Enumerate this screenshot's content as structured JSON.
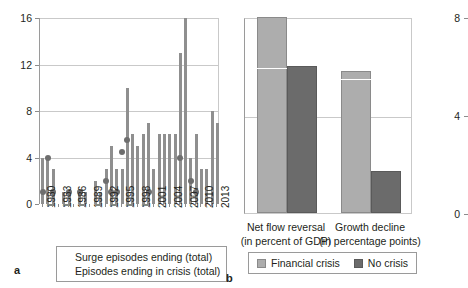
{
  "colors": {
    "light_gray": "#adadad",
    "dark_gray": "#6b6b6b",
    "bar_gray": "#8f8f8f",
    "dot_gray": "#6e6e6e",
    "grid": "#c9c9c9",
    "axis": "#8c8c8c"
  },
  "panel_a": {
    "letter": "a",
    "legend": [
      {
        "marker": "square",
        "label": "Surge episodes ending (total)"
      },
      {
        "marker": "circle",
        "label": "Episodes ending in crisis (total)"
      }
    ],
    "y_ticks": [
      "0",
      "4",
      "8",
      "12",
      "16"
    ],
    "y_values": [
      0,
      4,
      8,
      12,
      16
    ],
    "x_tick_labels": [
      "1980",
      "1983",
      "1986",
      "1989",
      "1992",
      "1995",
      "1998",
      "2001",
      "2004",
      "2007",
      "2010",
      "2013"
    ]
  },
  "panel_b": {
    "letter": "b",
    "y_ticks": [
      "0",
      "4",
      "8"
    ],
    "y_values": [
      0,
      4,
      8
    ],
    "categories": [
      {
        "line1": "Net  flow reversal",
        "line2": "(in percent of GDP)"
      },
      {
        "line1": "Growth decline",
        "line2": "(in percentage points)"
      }
    ],
    "legend": [
      {
        "swatch": "light",
        "label": "Financial crisis"
      },
      {
        "swatch": "dark",
        "label": "No crisis"
      }
    ]
  },
  "chart_data": [
    {
      "type": "bar",
      "panel": "a",
      "title": "",
      "xlabel": "",
      "ylabel": "",
      "ylim": [
        0,
        16
      ],
      "yticks": [
        0,
        4,
        8,
        12,
        16
      ],
      "grid": true,
      "legend_position": "bottom",
      "categories": [
        "1980",
        "1981",
        "1982",
        "1983",
        "1984",
        "1985",
        "1986",
        "1987",
        "1988",
        "1989",
        "1990",
        "1991",
        "1992",
        "1993",
        "1994",
        "1995",
        "1996",
        "1997",
        "1998",
        "1999",
        "2000",
        "2001",
        "2002",
        "2003",
        "2004",
        "2005",
        "2006",
        "2007",
        "2008",
        "2009",
        "2010",
        "2011",
        "2012",
        "2013"
      ],
      "series": [
        {
          "name": "Surge episodes ending (total)",
          "type": "bar",
          "values": [
            4,
            4,
            3,
            0,
            1,
            1,
            0,
            1,
            1,
            0,
            2,
            1,
            3,
            5,
            3,
            3,
            10,
            6,
            5,
            6,
            7,
            3,
            6,
            6,
            6,
            6,
            13,
            16,
            4,
            6,
            3,
            3,
            8,
            7
          ]
        },
        {
          "name": "Episodes ending in crisis (total)",
          "type": "scatter",
          "values": [
            1,
            4,
            1,
            null,
            null,
            1,
            null,
            1,
            null,
            null,
            null,
            null,
            2,
            1,
            1,
            4.5,
            5.5,
            null,
            null,
            null,
            1,
            null,
            null,
            null,
            null,
            null,
            4,
            null,
            2,
            1,
            null,
            null,
            null,
            null
          ]
        }
      ]
    },
    {
      "type": "bar",
      "panel": "b",
      "title": "",
      "xlabel": "",
      "ylabel": "",
      "ylim": [
        0,
        8
      ],
      "yticks": [
        0,
        4,
        8
      ],
      "grid": true,
      "legend_position": "bottom",
      "categories": [
        "Net flow reversal (in percent of GDP)",
        "Growth decline (in percentage points)"
      ],
      "series": [
        {
          "name": "Financial crisis",
          "values": [
            8.0,
            5.8
          ]
        },
        {
          "name": "No crisis",
          "values": [
            6.0,
            1.7
          ]
        }
      ]
    }
  ]
}
